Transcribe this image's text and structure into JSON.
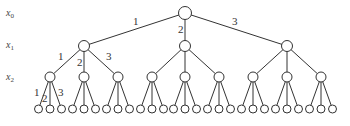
{
  "diagram": {
    "type": "tree",
    "branching_factor": 3,
    "depth": 3,
    "level_labels": [
      {
        "var": "x",
        "sub": "0",
        "y": 16
      },
      {
        "var": "x",
        "sub": "1",
        "y": 48
      },
      {
        "var": "x",
        "sub": "2",
        "y": 80
      }
    ],
    "edge_labels": {
      "root": [
        "1",
        "2",
        "3"
      ],
      "level1_first": [
        "1",
        "2",
        "3"
      ],
      "level2_first": [
        "1",
        "2",
        "3"
      ]
    },
    "colors": {
      "stroke": "#333333",
      "fill": "#ffffff"
    }
  }
}
